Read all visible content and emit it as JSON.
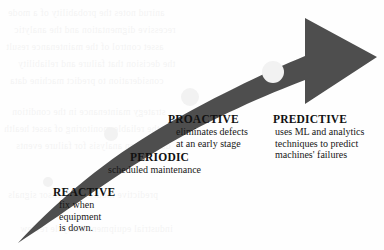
{
  "figure": {
    "arrow_color": "#4e4e4e",
    "marker_color": "#f2f2f2",
    "background_color": "#fefefe"
  },
  "stages": [
    {
      "id": "reactive",
      "title": "REACTIVE",
      "desc_lines": [
        "fix when",
        "equipment",
        "is down."
      ],
      "marker": {
        "cx": 48,
        "cy": 182,
        "r": 5
      }
    },
    {
      "id": "periodic",
      "title": "PERIODIC",
      "desc_lines": [
        "scheduled maintenance"
      ],
      "marker": {
        "cx": 111,
        "cy": 134,
        "r": 7
      }
    },
    {
      "id": "proactive",
      "title": "PROACTIVE",
      "desc_lines": [
        "eliminates defects",
        "at an early stage"
      ],
      "marker": {
        "cx": 190,
        "cy": 97,
        "r": 9
      }
    },
    {
      "id": "predictive",
      "title": "PREDICTIVE",
      "desc_lines": [
        "uses ML and analytics",
        "techniques to predict",
        "machines' failures"
      ],
      "marker": {
        "cx": 273,
        "cy": 72,
        "r": 11
      }
    }
  ],
  "background_bleed": {
    "lines": [
      "anirud notes the probability of a mode",
      "recessive digmentation and the analytic",
      "asset control of the maintenance result",
      "the decision that failure and reliability",
      "consideration to predict machine data",
      "strategy maintenance in the condition",
      "the reliable monitoring of asset health",
      "data driven analysis for failure events",
      "predictive models and sensor signals",
      "industrial equipment lifecycle review"
    ]
  }
}
